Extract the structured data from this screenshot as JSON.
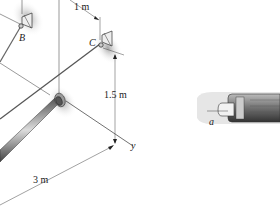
{
  "figure": {
    "points": {
      "B": "B",
      "C": "C",
      "a": "a"
    },
    "axes": {
      "y": "y"
    },
    "dimensions": {
      "top": "1 m",
      "vertical": "1.5 m",
      "horizontal": "3 m"
    }
  }
}
